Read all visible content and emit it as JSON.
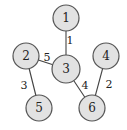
{
  "graph": {
    "nodes": [
      {
        "id": "1",
        "label": "1",
        "x": 66,
        "y": 18,
        "r": 13
      },
      {
        "id": "2",
        "label": "2",
        "x": 26,
        "y": 56,
        "r": 13
      },
      {
        "id": "3",
        "label": "3",
        "x": 66,
        "y": 69,
        "r": 14
      },
      {
        "id": "4",
        "label": "4",
        "x": 106,
        "y": 56,
        "r": 13
      },
      {
        "id": "5",
        "label": "5",
        "x": 39,
        "y": 108,
        "r": 13
      },
      {
        "id": "6",
        "label": "6",
        "x": 92,
        "y": 108,
        "r": 13
      }
    ],
    "edges": [
      {
        "from": "1",
        "to": "3",
        "weight": "1",
        "lx": 70,
        "ly": 44
      },
      {
        "from": "2",
        "to": "3",
        "weight": "5",
        "lx": 47,
        "ly": 61
      },
      {
        "from": "2",
        "to": "5",
        "weight": "3",
        "lx": 24,
        "ly": 89
      },
      {
        "from": "3",
        "to": "6",
        "weight": "4",
        "lx": 85,
        "ly": 89
      },
      {
        "from": "4",
        "to": "6",
        "weight": "2",
        "lx": 109,
        "ly": 88
      }
    ],
    "colors": {
      "node_fill": "#e2e2e2",
      "node_stroke": "#555555",
      "edge": "#444444",
      "text": "#222222"
    }
  }
}
